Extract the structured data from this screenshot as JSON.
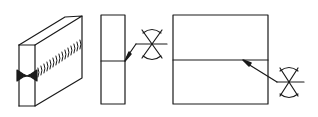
{
  "diagram": {
    "stroke_color": "#1a1a1a",
    "background": "#ffffff",
    "figures": [
      {
        "name": "3d-welded-block",
        "label": ""
      },
      {
        "name": "end-view-with-symbol",
        "label": ""
      },
      {
        "name": "front-view-with-symbol",
        "label": ""
      }
    ],
    "symbols": [
      {
        "name": "double-v-weld-symbol",
        "type": "X-groove (double V) with convex contour"
      },
      {
        "name": "double-v-weld-symbol",
        "type": "X-groove (double V) with convex contour"
      }
    ]
  }
}
